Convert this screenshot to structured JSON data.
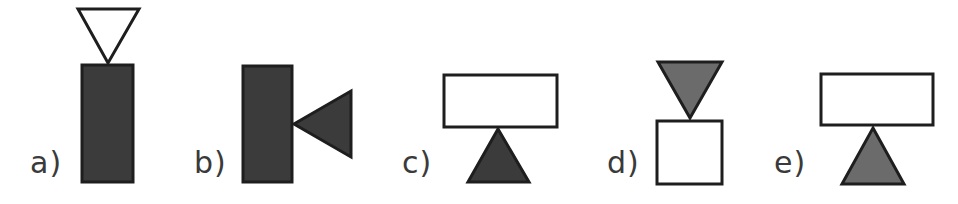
{
  "colors": {
    "dark": "#3b3b3b",
    "grey": "#6b6b6b",
    "white": "#ffffff",
    "stroke": "#1e1e1e",
    "label": "#3a3a3a"
  },
  "options": [
    {
      "label": "a)",
      "label_pos": [
        30,
        148
      ],
      "shapes": [
        {
          "type": "triangle",
          "name": "down-triangle",
          "fill": "white",
          "points": "78,9 139,9 108,63"
        },
        {
          "type": "rect",
          "name": "tall-rectangle",
          "fill": "dark",
          "x": 82,
          "y": 65,
          "w": 51,
          "h": 117
        }
      ]
    },
    {
      "label": "b)",
      "label_pos": [
        194,
        148
      ],
      "shapes": [
        {
          "type": "rect",
          "name": "tall-rectangle",
          "fill": "dark",
          "x": 243,
          "y": 66,
          "w": 49,
          "h": 116
        },
        {
          "type": "triangle",
          "name": "left-triangle",
          "fill": "dark",
          "points": "351,91 351,157 294,124"
        }
      ]
    },
    {
      "label": "c)",
      "label_pos": [
        402,
        148
      ],
      "shapes": [
        {
          "type": "rect",
          "name": "wide-rectangle",
          "fill": "white",
          "x": 444,
          "y": 75,
          "w": 113,
          "h": 52
        },
        {
          "type": "triangle",
          "name": "up-triangle",
          "fill": "dark",
          "points": "498,129 529,182 468,182"
        }
      ]
    },
    {
      "label": "d)",
      "label_pos": [
        607,
        148
      ],
      "shapes": [
        {
          "type": "triangle",
          "name": "down-triangle",
          "fill": "grey",
          "points": "658,62 722,62 690,118"
        },
        {
          "type": "rect",
          "name": "square",
          "fill": "white",
          "x": 657,
          "y": 121,
          "w": 65,
          "h": 63
        }
      ]
    },
    {
      "label": "e)",
      "label_pos": [
        774,
        148
      ],
      "shapes": [
        {
          "type": "rect",
          "name": "wide-rectangle",
          "fill": "white",
          "x": 821,
          "y": 74,
          "w": 112,
          "h": 51
        },
        {
          "type": "triangle",
          "name": "up-triangle",
          "fill": "grey",
          "points": "873,128 904,184 842,184"
        }
      ]
    }
  ]
}
